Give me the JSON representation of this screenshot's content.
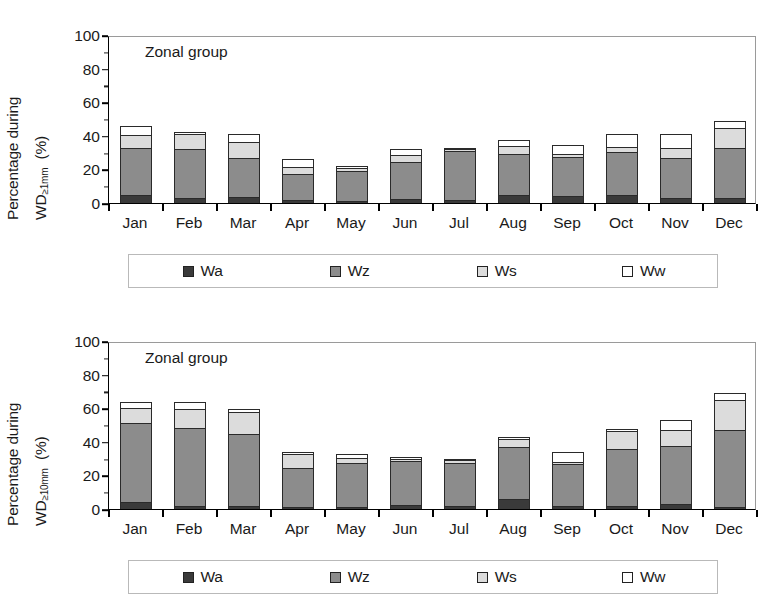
{
  "figure": {
    "panels": [
      {
        "id": "top",
        "annotation": "Zonal group",
        "ylabel_line1": "Percentage during",
        "ylabel_line2_main": "WD",
        "ylabel_line2_sub": "≥1mm",
        "ylabel_units": "(%)"
      },
      {
        "id": "bottom",
        "annotation": "Zonal group",
        "ylabel_line1": "Percentage during",
        "ylabel_line2_main": "WD",
        "ylabel_line2_sub": "≥10mm",
        "ylabel_units": "(%)"
      }
    ],
    "legend": {
      "items": [
        {
          "label": "Wa",
          "color": "#3a3a3a"
        },
        {
          "label": "Wz",
          "color": "#8c8c8c"
        },
        {
          "label": "Ws",
          "color": "#dcdcdc"
        },
        {
          "label": "Ww",
          "color": "#ffffff"
        }
      ]
    },
    "yticks": [
      "0",
      "20",
      "40",
      "60",
      "80",
      "100"
    ]
  },
  "chart_data": [
    {
      "type": "bar",
      "stacked": true,
      "title": "Zonal group",
      "xlabel": "",
      "ylabel": "Percentage during WD ≥1mm (%)",
      "ylim": [
        0,
        100
      ],
      "ytick_values": [
        0,
        20,
        40,
        60,
        80,
        100
      ],
      "grid": false,
      "legend_position": "below",
      "categories": [
        "Jan",
        "Feb",
        "Mar",
        "Apr",
        "May",
        "Jun",
        "Jul",
        "Aug",
        "Sep",
        "Oct",
        "Nov",
        "Dec"
      ],
      "series": [
        {
          "name": "Wa",
          "color": "#3a3a3a",
          "values": [
            5.0,
            3.0,
            3.5,
            1.5,
            1.0,
            2.5,
            2.0,
            4.5,
            4.0,
            4.5,
            3.0,
            3.0
          ]
        },
        {
          "name": "Wz",
          "color": "#8c8c8c",
          "values": [
            28.0,
            29.0,
            23.5,
            15.5,
            18.0,
            22.0,
            29.0,
            24.5,
            23.5,
            26.0,
            24.0,
            30.0
          ]
        },
        {
          "name": "Ws",
          "color": "#dcdcdc",
          "values": [
            7.5,
            9.0,
            9.5,
            4.5,
            2.0,
            4.0,
            1.0,
            5.0,
            1.5,
            3.0,
            6.0,
            11.5
          ]
        },
        {
          "name": "Ww",
          "color": "#ffffff",
          "values": [
            5.5,
            1.0,
            4.5,
            4.5,
            1.0,
            3.5,
            1.0,
            3.5,
            5.5,
            7.5,
            8.0,
            4.5
          ]
        }
      ],
      "totals": [
        46.0,
        42.0,
        41.0,
        26.0,
        22.0,
        32.0,
        33.0,
        37.5,
        34.5,
        41.0,
        41.0,
        49.0
      ]
    },
    {
      "type": "bar",
      "stacked": true,
      "title": "Zonal group",
      "xlabel": "",
      "ylabel": "Percentage during WD ≥10mm (%)",
      "ylim": [
        0,
        100
      ],
      "ytick_values": [
        0,
        20,
        40,
        60,
        80,
        100
      ],
      "grid": false,
      "legend_position": "below",
      "categories": [
        "Jan",
        "Feb",
        "Mar",
        "Apr",
        "May",
        "Jun",
        "Jul",
        "Aug",
        "Sep",
        "Oct",
        "Nov",
        "Dec"
      ],
      "series": [
        {
          "name": "Wa",
          "color": "#3a3a3a",
          "values": [
            4.0,
            2.0,
            2.0,
            1.0,
            1.0,
            2.5,
            2.0,
            6.0,
            2.0,
            2.0,
            3.0,
            1.0
          ]
        },
        {
          "name": "Wz",
          "color": "#8c8c8c",
          "values": [
            47.0,
            46.0,
            42.5,
            23.5,
            26.5,
            26.0,
            25.5,
            31.0,
            25.0,
            34.0,
            34.5,
            46.0
          ]
        },
        {
          "name": "Ws",
          "color": "#dcdcdc",
          "values": [
            9.0,
            11.5,
            13.5,
            8.0,
            3.0,
            1.5,
            1.5,
            4.5,
            1.0,
            10.5,
            9.5,
            18.0
          ]
        },
        {
          "name": "Ww",
          "color": "#ffffff",
          "values": [
            4.0,
            4.0,
            1.5,
            1.5,
            2.0,
            0.5,
            1.0,
            1.5,
            6.0,
            1.0,
            6.0,
            4.0
          ]
        }
      ],
      "totals": [
        64.0,
        63.5,
        59.5,
        34.0,
        32.5,
        30.5,
        30.0,
        43.0,
        34.0,
        47.5,
        53.0,
        69.0
      ]
    }
  ]
}
